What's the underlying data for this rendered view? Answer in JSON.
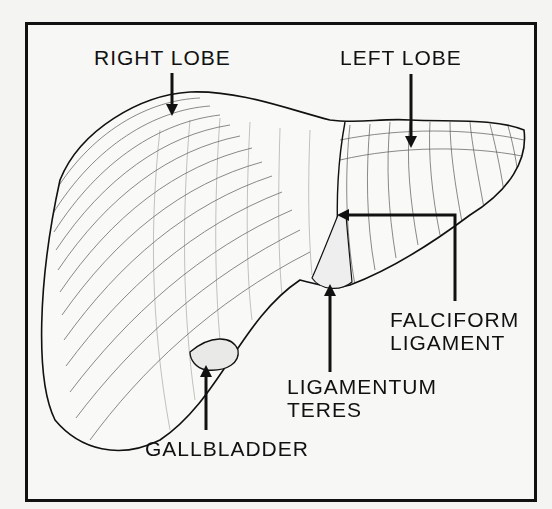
{
  "diagram": {
    "labels": {
      "right_lobe": "RIGHT LOBE",
      "left_lobe": "LEFT LOBE",
      "falciform_line1": "FALCIFORM",
      "falciform_line2": "LIGAMENT",
      "teres_line1": "LIGAMENTUM",
      "teres_line2": "TERES",
      "gallbladder": "GALLBLADDER"
    },
    "colors": {
      "ink": "#111111",
      "background": "#f7f7f5"
    }
  }
}
